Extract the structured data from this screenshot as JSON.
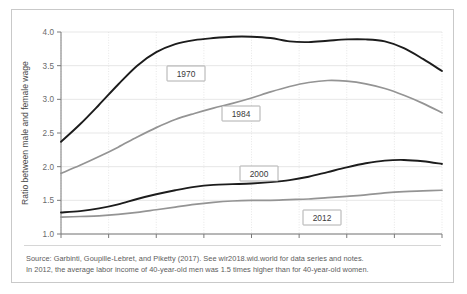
{
  "chart_data": {
    "type": "line",
    "title": "",
    "xlabel": "",
    "ylabel": "Ratio between male and female wage",
    "xlim": [
      25,
      65
    ],
    "ylim": [
      1.0,
      4.0
    ],
    "xticks": [
      "25",
      "30",
      "35",
      "40",
      "45",
      "50",
      "55",
      "60",
      "65"
    ],
    "yticks": [
      "1.0",
      "1.5",
      "2.0",
      "2.5",
      "3.0",
      "3.5",
      "4.0"
    ],
    "grid": true,
    "legend_position": "inline-labels",
    "x": [
      25,
      27,
      29,
      31,
      33,
      35,
      37,
      39,
      41,
      43,
      45,
      47,
      49,
      51,
      53,
      55,
      57,
      59,
      61,
      63,
      65
    ],
    "series": [
      {
        "name": "1970",
        "color": "#1c1c1c",
        "values": [
          2.37,
          2.63,
          2.92,
          3.22,
          3.5,
          3.7,
          3.82,
          3.88,
          3.91,
          3.93,
          3.93,
          3.91,
          3.86,
          3.85,
          3.87,
          3.89,
          3.89,
          3.86,
          3.76,
          3.6,
          3.42
        ]
      },
      {
        "name": "1984",
        "color": "#949494",
        "values": [
          1.9,
          2.02,
          2.15,
          2.29,
          2.44,
          2.58,
          2.7,
          2.79,
          2.87,
          2.94,
          3.02,
          3.11,
          3.19,
          3.25,
          3.28,
          3.27,
          3.23,
          3.16,
          3.06,
          2.94,
          2.8
        ]
      },
      {
        "name": "2000",
        "color": "#1c1c1c",
        "values": [
          1.32,
          1.34,
          1.38,
          1.44,
          1.52,
          1.59,
          1.65,
          1.7,
          1.73,
          1.74,
          1.75,
          1.77,
          1.8,
          1.85,
          1.92,
          1.99,
          2.05,
          2.09,
          2.1,
          2.08,
          2.04
        ]
      },
      {
        "name": "2012",
        "color": "#949494",
        "values": [
          1.25,
          1.26,
          1.27,
          1.29,
          1.32,
          1.36,
          1.4,
          1.44,
          1.47,
          1.49,
          1.5,
          1.5,
          1.51,
          1.52,
          1.54,
          1.56,
          1.58,
          1.61,
          1.63,
          1.64,
          1.65
        ]
      }
    ],
    "series_labels": [
      {
        "name": "1970",
        "text": "1970",
        "x": 155,
        "y": 56
      },
      {
        "name": "1984",
        "text": "1984",
        "x": 210,
        "y": 96
      },
      {
        "name": "2000",
        "text": "2000",
        "x": 228,
        "y": 156
      },
      {
        "name": "2012",
        "text": "2012",
        "x": 291,
        "y": 200
      }
    ]
  },
  "notes": {
    "source_line": "Source: Garbinti, Goupille-Lebret, and Piketty (2017). See wir2018.wid.world for data series and notes.",
    "interpretation_line": "In 2012, the average labor income of 40-year-old men was 1.5 times higher than for 40-year-old women."
  },
  "colors": {
    "dark_series": "#1c1c1c",
    "gray_series": "#949494",
    "grid": "#dcdcdc",
    "axis": "#7a7a7a",
    "frame": "#c9c9c9",
    "note_text": "#5c5c5c"
  }
}
